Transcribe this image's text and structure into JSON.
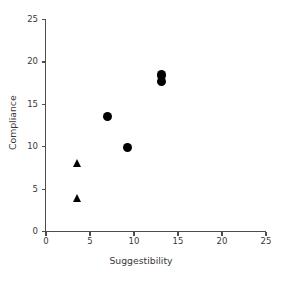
{
  "chart_data": {
    "type": "scatter",
    "title": "",
    "xlabel": "Suggestibility",
    "ylabel": "Compliance",
    "xlim": [
      0,
      25
    ],
    "ylim": [
      0,
      25
    ],
    "xticks": [
      0,
      5,
      10,
      15,
      20,
      25
    ],
    "yticks": [
      0,
      5,
      10,
      15,
      20,
      25
    ],
    "xtick_labels": [
      "0",
      "5",
      "10",
      "15",
      "20",
      "25"
    ],
    "ytick_labels": [
      "0",
      "5",
      "10",
      "15",
      "20",
      "25"
    ],
    "grid": false,
    "legend": null,
    "series": [
      {
        "name": "circles",
        "marker": "circle",
        "color": "#000000",
        "points": [
          {
            "x": 7.0,
            "y": 13.5
          },
          {
            "x": 9.3,
            "y": 9.8
          },
          {
            "x": 13.1,
            "y": 18.4
          },
          {
            "x": 13.1,
            "y": 17.6
          }
        ]
      },
      {
        "name": "triangles",
        "marker": "triangle",
        "color": "#000000",
        "points": [
          {
            "x": 3.6,
            "y": 8.0
          },
          {
            "x": 3.6,
            "y": 3.8
          }
        ]
      }
    ]
  },
  "colors": {
    "axis": "#4d4d4d",
    "marker": "#000000",
    "text": "#3b3738",
    "background": "#ffffff"
  }
}
